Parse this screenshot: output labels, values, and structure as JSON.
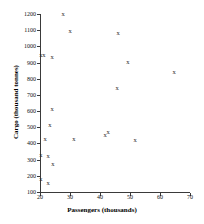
{
  "chart_data": {
    "type": "scatter",
    "title": "",
    "xlabel": "Passengers (thousands)",
    "ylabel": "Cargo (thousand tonnes)",
    "xlim": [
      20,
      70
    ],
    "ylim": [
      100,
      1200
    ],
    "xticks": [
      20,
      30,
      40,
      50,
      60,
      70
    ],
    "yticks": [
      100,
      200,
      300,
      400,
      500,
      600,
      700,
      800,
      900,
      1000,
      1100,
      1200
    ],
    "grid": false,
    "legend": null,
    "marker": "x",
    "series": [
      {
        "name": "Airports",
        "points": [
          {
            "x": 27.7,
            "y": 1200,
            "label": "x"
          },
          {
            "x": 30.0,
            "y": 1096,
            "label": "x"
          },
          {
            "x": 46.0,
            "y": 1080,
            "label": "x"
          },
          {
            "x": 20.3,
            "y": 948,
            "label": "x"
          },
          {
            "x": 21.3,
            "y": 948,
            "label": "x"
          },
          {
            "x": 24.0,
            "y": 935,
            "label": "x"
          },
          {
            "x": 49.3,
            "y": 905,
            "label": "x"
          },
          {
            "x": 64.7,
            "y": 840,
            "label": "x"
          },
          {
            "x": 45.7,
            "y": 745,
            "label": "x"
          },
          {
            "x": 24.0,
            "y": 610,
            "label": "x"
          },
          {
            "x": 23.3,
            "y": 513,
            "label": "x"
          },
          {
            "x": 21.7,
            "y": 427,
            "label": "x"
          },
          {
            "x": 31.3,
            "y": 425,
            "label": "x"
          },
          {
            "x": 41.7,
            "y": 450,
            "label": "x"
          },
          {
            "x": 42.7,
            "y": 470,
            "label": "x"
          },
          {
            "x": 51.7,
            "y": 423,
            "label": "x"
          },
          {
            "x": 20.3,
            "y": 330,
            "label": "x"
          },
          {
            "x": 22.7,
            "y": 320,
            "label": "x"
          },
          {
            "x": 24.3,
            "y": 272,
            "label": "x"
          },
          {
            "x": 20.3,
            "y": 180,
            "label": "x"
          },
          {
            "x": 22.7,
            "y": 155,
            "label": "x"
          }
        ]
      }
    ]
  },
  "axes": {
    "x_title": "Passengers (thousands)",
    "y_title": "Cargo (thousand tonnes)",
    "x_tick_labels": [
      "20",
      "30",
      "40",
      "50",
      "60",
      "70"
    ],
    "y_tick_labels": [
      "100",
      "200",
      "300",
      "400",
      "500",
      "600",
      "700",
      "800",
      "900",
      "1000",
      "1100",
      "1200"
    ]
  },
  "style": {
    "marker_glyph": "x",
    "marker_color": "#2b2b2b",
    "axis_color": "#3a3a3a",
    "background": "#ffffff"
  }
}
